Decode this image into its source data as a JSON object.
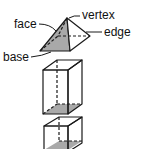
{
  "diagram": {
    "labels": {
      "face": "face",
      "vertex": "vertex",
      "edge": "edge",
      "base": "base"
    },
    "shapes": [
      "square pyramid",
      "rectangular prism",
      "cube"
    ],
    "colors": {
      "line": "#1a1a1a",
      "shade": "#a9a9a9",
      "background": "#ffffff"
    }
  }
}
